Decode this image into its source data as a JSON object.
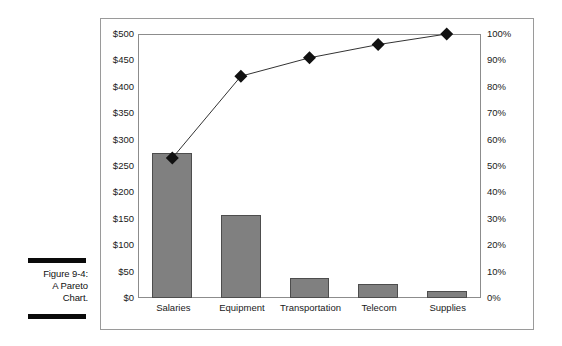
{
  "caption": {
    "figure_number": "Figure 9-4:",
    "line2": "A Pareto",
    "line3": "Chart."
  },
  "chart_data": {
    "type": "bar",
    "title": "",
    "xlabel": "",
    "ylabel": "",
    "categories": [
      "Salaries",
      "Equipment",
      "Transportation",
      "Telecom",
      "Supplies"
    ],
    "values": [
      275,
      158,
      38,
      26,
      13
    ],
    "series": [
      {
        "name": "Cost",
        "type": "bar",
        "axis": "left",
        "values": [
          275,
          158,
          38,
          26,
          13
        ]
      },
      {
        "name": "Cumulative Percent",
        "type": "line",
        "axis": "right",
        "values": [
          53,
          84,
          91,
          96,
          100
        ]
      }
    ],
    "ylim": [
      0,
      500
    ],
    "y2lim": [
      0,
      100
    ],
    "yticks": [
      "$0",
      "$50",
      "$100",
      "$150",
      "$200",
      "$250",
      "$300",
      "$350",
      "$400",
      "$450",
      "$500"
    ],
    "ytick_values": [
      0,
      50,
      100,
      150,
      200,
      250,
      300,
      350,
      400,
      450,
      500
    ],
    "y2ticks": [
      "0%",
      "10%",
      "20%",
      "30%",
      "40%",
      "50%",
      "60%",
      "70%",
      "80%",
      "90%",
      "100%"
    ],
    "y2tick_values": [
      0,
      10,
      20,
      30,
      40,
      50,
      60,
      70,
      80,
      90,
      100
    ],
    "grid": false,
    "legend": "none",
    "bar_color": "#808080",
    "bar_edge_color": "#4d4d4d",
    "line_color": "#333333",
    "marker": "diamond",
    "marker_color": "#111111"
  }
}
